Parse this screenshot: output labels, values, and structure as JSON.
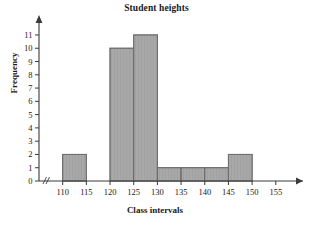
{
  "chart_data": {
    "type": "bar",
    "title": "Student heights",
    "xlabel": "Class intervals",
    "ylabel": "Frequency",
    "categories": [
      "110-115",
      "115-120",
      "120-125",
      "125-130",
      "130-135",
      "135-140",
      "140-145",
      "145-150"
    ],
    "bin_edges": [
      110,
      115,
      120,
      125,
      130,
      135,
      140,
      145,
      150
    ],
    "values": [
      2,
      0,
      10,
      11,
      1,
      1,
      1,
      2
    ],
    "bars": [
      {
        "start": 110,
        "end": 115,
        "value": 2
      },
      {
        "start": 115,
        "end": 120,
        "value": 0
      },
      {
        "start": 120,
        "end": 125,
        "value": 10
      },
      {
        "start": 125,
        "end": 130,
        "value": 11
      },
      {
        "start": 130,
        "end": 135,
        "value": 1
      },
      {
        "start": 135,
        "end": 140,
        "value": 1
      },
      {
        "start": 140,
        "end": 145,
        "value": 1
      },
      {
        "start": 145,
        "end": 150,
        "value": 2
      }
    ],
    "xticks": [
      110,
      115,
      120,
      125,
      130,
      135,
      140,
      145,
      150,
      155
    ],
    "xtick_labels": [
      "110",
      "115",
      "120",
      "125",
      "130",
      "135",
      "140",
      "145",
      "150",
      "155"
    ],
    "yticks": [
      0,
      1,
      2,
      3,
      4,
      5,
      6,
      7,
      8,
      9,
      10,
      11
    ],
    "ytick_labels": [
      "0",
      "1",
      "2",
      "3",
      "4",
      "5",
      "6",
      "7",
      "8",
      "9",
      "10",
      "11"
    ],
    "xlim": [
      105,
      158
    ],
    "ylim": [
      0,
      11.6
    ],
    "grid": false,
    "legend": null,
    "x_axis_break": "//",
    "bar_fill_color": "#a8a8a8",
    "bar_edge_color": "#6e6e6e",
    "axis_color": "#3a3a3a",
    "axis_arrows": [
      "x-right",
      "y-top"
    ]
  }
}
